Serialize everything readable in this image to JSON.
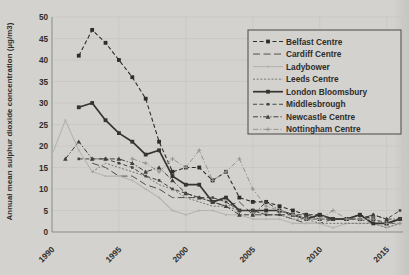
{
  "chart_data": {
    "type": "line",
    "ylabel": "Annual mean sulphur dioxide concentration (µg/m3)",
    "xlabel": "",
    "title": "",
    "xlim": [
      1990,
      2016
    ],
    "ylim": [
      0,
      50
    ],
    "xticks": [
      1990,
      1995,
      2000,
      2005,
      2010,
      2015
    ],
    "yticks": [
      0,
      5,
      10,
      15,
      20,
      25,
      30,
      35,
      40,
      45,
      50
    ],
    "grid": true,
    "legend_position": "top-right",
    "series": [
      {
        "name": "Belfast Centre",
        "color": "#2e2d2b",
        "dash": "4 2.5",
        "width": 1.1,
        "marker": "square",
        "points": [
          [
            1992,
            41
          ],
          [
            1993,
            47
          ],
          [
            1994,
            44
          ],
          [
            1995,
            40
          ],
          [
            1996,
            36
          ],
          [
            1997,
            31
          ],
          [
            1998,
            21
          ],
          [
            1999,
            14
          ],
          [
            2000,
            15
          ],
          [
            2001,
            15
          ],
          [
            2002,
            12
          ],
          [
            2003,
            14
          ],
          [
            2004,
            8
          ],
          [
            2005,
            7
          ],
          [
            2006,
            7
          ],
          [
            2007,
            6
          ],
          [
            2008,
            5
          ],
          [
            2009,
            4
          ],
          [
            2010,
            4
          ],
          [
            2011,
            3
          ],
          [
            2012,
            3
          ],
          [
            2013,
            4
          ],
          [
            2014,
            3
          ],
          [
            2015,
            2
          ],
          [
            2016,
            3
          ]
        ]
      },
      {
        "name": "Cardiff Centre",
        "color": "#504f4d",
        "dash": "7 3.5",
        "width": 1.0,
        "marker": "none",
        "points": [
          [
            1993,
            16
          ],
          [
            1994,
            15
          ],
          [
            1995,
            13
          ],
          [
            1996,
            13
          ],
          [
            1997,
            11
          ],
          [
            1998,
            10
          ],
          [
            1999,
            8
          ],
          [
            2000,
            8
          ],
          [
            2001,
            8
          ],
          [
            2002,
            7
          ],
          [
            2003,
            6
          ],
          [
            2004,
            7
          ],
          [
            2005,
            4
          ],
          [
            2006,
            4
          ],
          [
            2007,
            4
          ],
          [
            2008,
            3
          ],
          [
            2009,
            2
          ],
          [
            2010,
            2
          ],
          [
            2011,
            3
          ],
          [
            2012,
            3
          ],
          [
            2013,
            3
          ],
          [
            2014,
            2
          ],
          [
            2015,
            2
          ],
          [
            2016,
            2
          ]
        ]
      },
      {
        "name": "Ladybower",
        "color": "#b5b4b0",
        "dash": "",
        "width": 1.1,
        "marker": "dot",
        "points": [
          [
            1990,
            18
          ],
          [
            1991,
            26
          ],
          [
            1992,
            19
          ],
          [
            1993,
            14
          ],
          [
            1994,
            13
          ],
          [
            1995,
            13
          ],
          [
            1996,
            12
          ],
          [
            1997,
            10
          ],
          [
            1998,
            8
          ],
          [
            1999,
            5
          ],
          [
            2000,
            4
          ],
          [
            2001,
            5
          ],
          [
            2002,
            5
          ],
          [
            2003,
            4
          ],
          [
            2004,
            4
          ],
          [
            2005,
            3
          ],
          [
            2006,
            3
          ],
          [
            2007,
            3
          ],
          [
            2008,
            2
          ],
          [
            2009,
            2
          ],
          [
            2010,
            2
          ],
          [
            2011,
            1
          ],
          [
            2012,
            2
          ],
          [
            2013,
            2
          ],
          [
            2014,
            2
          ],
          [
            2015,
            1
          ],
          [
            2016,
            2
          ]
        ]
      },
      {
        "name": "Leeds Centre",
        "color": "#777672",
        "dash": "2 1.7",
        "width": 1.0,
        "marker": "none",
        "points": [
          [
            1993,
            14
          ],
          [
            1994,
            16
          ],
          [
            1995,
            15
          ],
          [
            1996,
            14
          ],
          [
            1997,
            13
          ],
          [
            1998,
            11
          ],
          [
            1999,
            10
          ],
          [
            2000,
            8
          ],
          [
            2001,
            7
          ],
          [
            2002,
            6
          ],
          [
            2003,
            6
          ],
          [
            2004,
            5
          ],
          [
            2005,
            5
          ],
          [
            2006,
            4
          ],
          [
            2007,
            4
          ],
          [
            2008,
            3
          ],
          [
            2009,
            3
          ],
          [
            2010,
            2
          ],
          [
            2011,
            2
          ],
          [
            2012,
            2
          ],
          [
            2013,
            2
          ],
          [
            2014,
            2
          ],
          [
            2015,
            1
          ],
          [
            2016,
            2
          ]
        ]
      },
      {
        "name": "London Bloomsbury",
        "color": "#35342f",
        "dash": "",
        "width": 1.7,
        "marker": "square",
        "points": [
          [
            1992,
            29
          ],
          [
            1993,
            30
          ],
          [
            1994,
            26
          ],
          [
            1995,
            23
          ],
          [
            1996,
            21
          ],
          [
            1997,
            18
          ],
          [
            1998,
            19
          ],
          [
            1999,
            13
          ],
          [
            2000,
            11
          ],
          [
            2001,
            11
          ],
          [
            2002,
            7
          ],
          [
            2003,
            8
          ],
          [
            2004,
            5
          ],
          [
            2005,
            5
          ],
          [
            2006,
            5
          ],
          [
            2007,
            5
          ],
          [
            2008,
            4
          ],
          [
            2009,
            3
          ],
          [
            2010,
            4
          ],
          [
            2011,
            3
          ],
          [
            2012,
            3
          ],
          [
            2013,
            4
          ],
          [
            2014,
            2
          ],
          [
            2015,
            2
          ],
          [
            2016,
            3
          ]
        ]
      },
      {
        "name": "Middlesbrough",
        "color": "#454441",
        "dash": "4 2.5",
        "width": 1.0,
        "marker": "square-small",
        "points": [
          [
            1992,
            17
          ],
          [
            1993,
            17
          ],
          [
            1994,
            17
          ],
          [
            1995,
            16
          ],
          [
            1996,
            15
          ],
          [
            1997,
            13
          ],
          [
            1998,
            12
          ],
          [
            1999,
            10
          ],
          [
            2000,
            9
          ],
          [
            2001,
            8
          ],
          [
            2002,
            8
          ],
          [
            2003,
            7
          ],
          [
            2004,
            5
          ],
          [
            2005,
            5
          ],
          [
            2006,
            4
          ],
          [
            2007,
            4
          ],
          [
            2008,
            4
          ],
          [
            2009,
            3
          ],
          [
            2010,
            3
          ],
          [
            2011,
            3
          ],
          [
            2012,
            3
          ],
          [
            2013,
            3
          ],
          [
            2014,
            4
          ],
          [
            2015,
            3
          ],
          [
            2016,
            5
          ]
        ]
      },
      {
        "name": "Newcastle Centre",
        "color": "#403f3c",
        "dash": "5 2 1.2 2",
        "width": 1.0,
        "marker": "triangle",
        "points": [
          [
            1991,
            17
          ],
          [
            1992,
            21
          ],
          [
            1993,
            17
          ],
          [
            1994,
            17
          ],
          [
            1995,
            17
          ],
          [
            1996,
            16
          ],
          [
            1997,
            14
          ],
          [
            1998,
            15
          ],
          [
            1999,
            12
          ],
          [
            2000,
            9
          ],
          [
            2001,
            8
          ],
          [
            2002,
            7
          ],
          [
            2003,
            6
          ],
          [
            2004,
            4
          ],
          [
            2005,
            4
          ],
          [
            2006,
            7
          ],
          [
            2007,
            5
          ],
          [
            2008,
            4
          ],
          [
            2009,
            4
          ],
          [
            2010,
            3
          ],
          [
            2011,
            3
          ],
          [
            2012,
            3
          ],
          [
            2013,
            3
          ],
          [
            2014,
            4
          ],
          [
            2015,
            3
          ],
          [
            2016,
            3
          ]
        ]
      },
      {
        "name": "Nottingham Centre",
        "color": "#94938f",
        "dash": "5 2 1.2 2",
        "width": 1.0,
        "marker": "plus",
        "points": [
          [
            1996,
            17
          ],
          [
            1997,
            16
          ],
          [
            1998,
            14
          ],
          [
            1999,
            17
          ],
          [
            2000,
            15
          ],
          [
            2001,
            19
          ],
          [
            2002,
            12
          ],
          [
            2003,
            14
          ],
          [
            2004,
            17
          ],
          [
            2005,
            10
          ],
          [
            2006,
            6
          ],
          [
            2007,
            5
          ],
          [
            2008,
            4
          ],
          [
            2009,
            3
          ],
          [
            2010,
            3
          ],
          [
            2011,
            5
          ],
          [
            2012,
            3
          ],
          [
            2013,
            3
          ],
          [
            2014,
            3
          ],
          [
            2015,
            2
          ],
          [
            2016,
            2
          ]
        ]
      }
    ],
    "colors": {
      "background": "#d3d2ce",
      "gridline": "#c6c5c1",
      "axis": "#8b8b87",
      "text": "#2e2d2b",
      "legend_border": "#4a4947"
    }
  }
}
